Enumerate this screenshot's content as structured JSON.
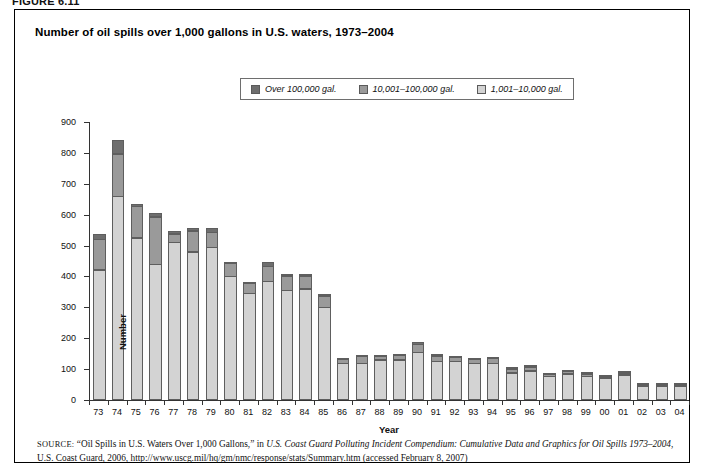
{
  "figure": {
    "label": "FIGURE 6.11"
  },
  "chart_title": "Number of oil spills over 1,000 gallons in U.S. waters, 1973–2004",
  "legend": {
    "items": [
      {
        "label": "Over 100,000 gal.",
        "color": "#6e6e6e",
        "key": "large"
      },
      {
        "label": "10,001–100,000 gal.",
        "color": "#9a9a9a",
        "key": "mid"
      },
      {
        "label": "1,001–10,000 gal.",
        "color": "#d3d3d3",
        "key": "small"
      }
    ]
  },
  "source": {
    "keyword": "SOURCE:",
    "line1_plain_a": " “Oil Spills in U.S. Waters Over 1,000 Gallons,” in ",
    "line1_italic": "U.S. Coast Guard Polluting Incident Compendium: Cumulative Data and Graphics for Oil Spills 1973–2004",
    "line2_plain": ", U.S. Coast Guard, 2006, http://www.uscg.mil/hq/gm/nmc/response/stats/Summary.htm (accessed February 8, 2007)"
  },
  "chart_data": {
    "type": "bar",
    "subtype": "stacked-vertical",
    "title": "Number of oil spills over 1,000 gallons in U.S. waters, 1973–2004",
    "xlabel": "Year",
    "ylabel": "Number",
    "ylim": [
      0,
      900
    ],
    "ytick_step": 100,
    "yticks": [
      0,
      100,
      200,
      300,
      400,
      500,
      600,
      700,
      800,
      900
    ],
    "grid": false,
    "legend_position": "top-center",
    "categories": [
      "73",
      "74",
      "75",
      "76",
      "77",
      "78",
      "79",
      "80",
      "81",
      "82",
      "83",
      "84",
      "85",
      "86",
      "87",
      "88",
      "89",
      "90",
      "91",
      "92",
      "93",
      "94",
      "95",
      "96",
      "97",
      "98",
      "99",
      "00",
      "01",
      "02",
      "03",
      "04"
    ],
    "series": [
      {
        "name": "1,001–10,000 gal.",
        "color": "#d3d3d3",
        "values": [
          422,
          660,
          525,
          440,
          510,
          480,
          495,
          400,
          345,
          385,
          355,
          360,
          300,
          120,
          120,
          130,
          130,
          155,
          125,
          125,
          120,
          120,
          88,
          95,
          78,
          85,
          78,
          72,
          82,
          45,
          45,
          45
        ]
      },
      {
        "name": "10,001–100,000 gal.",
        "color": "#9a9a9a",
        "values": [
          100,
          140,
          105,
          155,
          30,
          70,
          50,
          45,
          35,
          50,
          50,
          45,
          40,
          14,
          23,
          13,
          18,
          28,
          20,
          15,
          14,
          18,
          15,
          15,
          8,
          10,
          9,
          6,
          8,
          6,
          5,
          5
        ]
      },
      {
        "name": "Over 100,000 gal.",
        "color": "#6e6e6e",
        "values": [
          18,
          45,
          10,
          15,
          10,
          10,
          15,
          5,
          5,
          15,
          8,
          8,
          5,
          5,
          5,
          5,
          3,
          8,
          5,
          5,
          5,
          3,
          3,
          5,
          3,
          3,
          3,
          3,
          3,
          2,
          2,
          2
        ]
      }
    ],
    "totals": [
      540,
      845,
      640,
      610,
      550,
      560,
      560,
      450,
      385,
      450,
      413,
      413,
      345,
      139,
      148,
      148,
      151,
      191,
      150,
      145,
      139,
      141,
      106,
      115,
      89,
      98,
      90,
      81,
      93,
      53,
      52,
      52
    ]
  }
}
